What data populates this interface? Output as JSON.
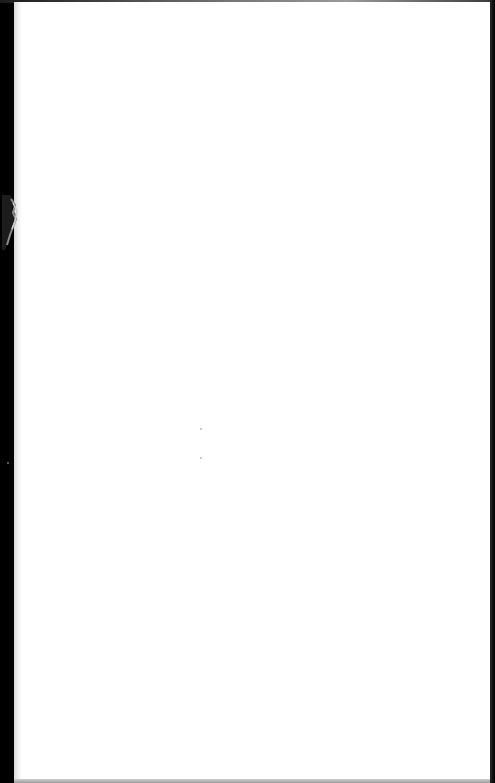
{
  "document": {
    "type": "scanned-page",
    "content": "",
    "state": "blank"
  },
  "colors": {
    "page": "#ffffff",
    "binding_edge": "#000000",
    "right_edge": "#111111"
  }
}
